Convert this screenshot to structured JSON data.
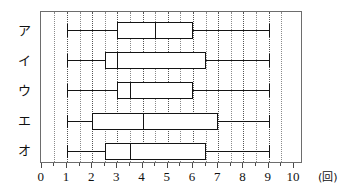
{
  "chart_data": {
    "type": "box",
    "title": "",
    "xlabel": "",
    "ylabel": "",
    "unit_label": "(回)",
    "xlim": [
      0,
      10
    ],
    "xticks": [
      0,
      1,
      2,
      3,
      4,
      5,
      6,
      7,
      8,
      9,
      10
    ],
    "xtick_labels": [
      "0",
      "1",
      "2",
      "3",
      "4",
      "5",
      "6",
      "7",
      "8",
      "9",
      "10"
    ],
    "minor_tick_step": 0.5,
    "grid": "vertical dotted at every 0.5 unit",
    "legend": "none",
    "categories": [
      "ア",
      "イ",
      "ウ",
      "エ",
      "オ"
    ],
    "series": [
      {
        "name": "ア",
        "min": 1,
        "q1": 3,
        "median": 4.5,
        "q3": 6,
        "max": 9
      },
      {
        "name": "イ",
        "min": 1,
        "q1": 2.5,
        "median": 3,
        "q3": 6.5,
        "max": 9
      },
      {
        "name": "ウ",
        "min": 1,
        "q1": 3,
        "median": 3.5,
        "q3": 6,
        "max": 9
      },
      {
        "name": "エ",
        "min": 1,
        "q1": 2,
        "median": 4,
        "q3": 7,
        "max": 9
      },
      {
        "name": "オ",
        "min": 1,
        "q1": 2.5,
        "median": 3.5,
        "q3": 6.5,
        "max": 9
      }
    ],
    "colors": {
      "box_stroke": "#141414",
      "frame": "#6d6d6d",
      "grid": "#8a8a8a",
      "background": "#ffffff",
      "text": "#111111"
    }
  }
}
